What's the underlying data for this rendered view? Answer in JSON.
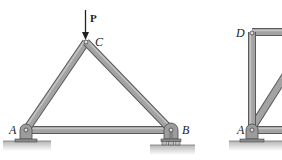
{
  "figure": {
    "left_truss": {
      "joints": [
        {
          "id": "A",
          "label": "A",
          "x": 26,
          "y": 130,
          "support": "pin"
        },
        {
          "id": "B",
          "label": "B",
          "x": 171,
          "y": 130,
          "support": "roller"
        },
        {
          "id": "C",
          "label": "C",
          "x": 86,
          "y": 42,
          "support": "none"
        }
      ],
      "members": [
        [
          "A",
          "C"
        ],
        [
          "C",
          "B"
        ],
        [
          "A",
          "B"
        ]
      ],
      "load": {
        "label": "P",
        "at": "C",
        "direction": "down"
      }
    },
    "right_truss": {
      "joints": [
        {
          "id": "D",
          "label": "D",
          "x": 252,
          "y": 32
        },
        {
          "id": "A",
          "label": "A",
          "x": 252,
          "y": 130,
          "support": "pin"
        }
      ],
      "note": "partially cropped at right edge"
    },
    "colors": {
      "member_fill": "#a3a3a3",
      "member_edge": "#5a5a5a",
      "ground": "#c8c8c8",
      "text": "#222222"
    }
  }
}
